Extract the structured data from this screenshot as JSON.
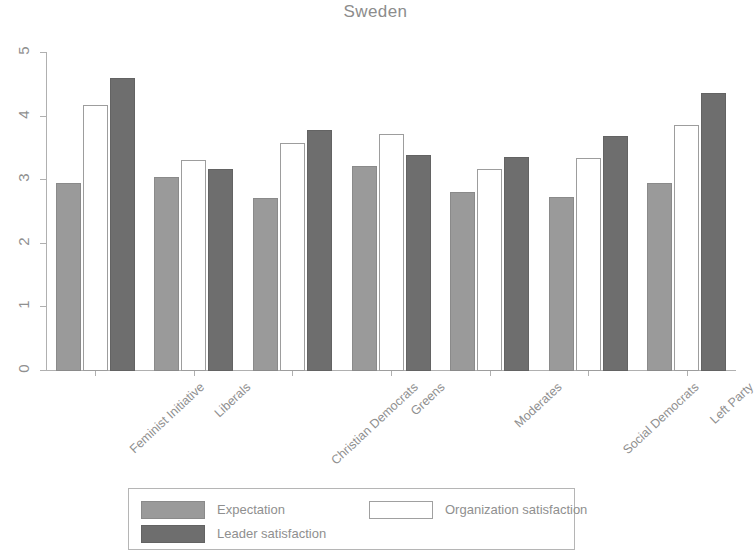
{
  "chart_data": {
    "type": "bar",
    "title": "Sweden",
    "xlabel": "",
    "ylabel": "",
    "ylim": [
      0,
      5
    ],
    "yticks": [
      0,
      1,
      2,
      3,
      4,
      5
    ],
    "ytick_labels": [
      "0",
      "1",
      "2",
      "3",
      "4",
      "5"
    ],
    "grid": false,
    "legend_position": "bottom",
    "categories": [
      "Feminist Initiative",
      "Liberals",
      "Christian Democrats",
      "Greens",
      "Moderates",
      "Social Democrats",
      "Left Party"
    ],
    "series": [
      {
        "name": "Expectation",
        "color": "#9a9a9a",
        "style": "filled-light",
        "values": [
          2.95,
          3.05,
          2.72,
          3.22,
          2.82,
          2.73,
          2.95
        ]
      },
      {
        "name": "Organization satisfaction",
        "color": "#ffffff",
        "style": "outline",
        "values": [
          4.18,
          3.31,
          3.58,
          3.72,
          3.18,
          3.35,
          3.87
        ]
      },
      {
        "name": "Leader satisfaction",
        "color": "#6e6e6e",
        "style": "filled-dark",
        "values": [
          4.6,
          3.17,
          3.79,
          3.4,
          3.37,
          3.7,
          4.37
        ]
      }
    ]
  },
  "legend": {
    "entries": [
      {
        "label": "Expectation",
        "swatch": "expectation"
      },
      {
        "label": "Organization satisfaction",
        "swatch": "organization"
      },
      {
        "label": "Leader satisfaction",
        "swatch": "leader"
      }
    ]
  }
}
